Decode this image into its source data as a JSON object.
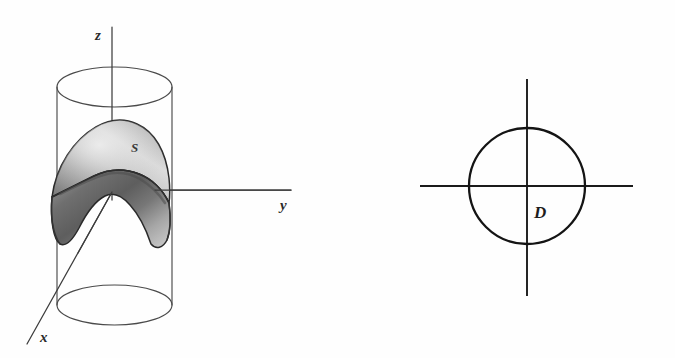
{
  "figure": {
    "title": "",
    "background_color": "#fefefe",
    "ink_color": "#2b2b2b"
  },
  "left_panel": {
    "name": "cylinder-with-saddle-surface",
    "axes": {
      "z_label": "z",
      "y_label": "y",
      "x_label": "x"
    },
    "surface": {
      "label": "S",
      "shape": "saddle",
      "fill_light": "#d2d2d2",
      "fill_dark": "#8d8d8d",
      "outline_color": "#2a2a2a"
    },
    "cylinder": {
      "label": "",
      "outline_color": "#4a4a4a"
    }
  },
  "right_panel": {
    "name": "disk-region",
    "region_label": "D",
    "circle_color": "#141414",
    "axis_color": "#1a1a1a"
  }
}
